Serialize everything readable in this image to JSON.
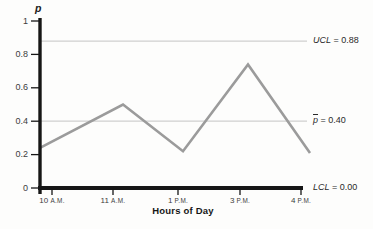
{
  "chart_data": {
    "type": "line",
    "title": "",
    "xlabel": "Hours of Day",
    "ylabel": "p",
    "categories": [
      "10 A.M.",
      "11 A.M.",
      "1 P.M.",
      "3 P.M.",
      "4 P.M."
    ],
    "values": [
      0.24,
      0.5,
      0.22,
      0.74,
      0.21
    ],
    "ylim": [
      0,
      1
    ],
    "y_tick_values": [
      1,
      0.8,
      0.6,
      0.4,
      0.2,
      0
    ],
    "y_tick_labels": [
      "1",
      "0.8",
      "0.6",
      "0.4",
      "0.2",
      "0"
    ],
    "grid": false,
    "legend": "none",
    "reference_lines": [
      {
        "name": "UCL",
        "var": "UCL",
        "value": 0.88,
        "display": "0.88",
        "overline": false,
        "label": "UCL = 0.88"
      },
      {
        "name": "pbar",
        "var": "p",
        "value": 0.4,
        "display": "0.40",
        "overline": true,
        "label": "p̄ = 0.40"
      },
      {
        "name": "LCL",
        "var": "LCL",
        "value": 0.0,
        "display": "0.00",
        "overline": false,
        "label": "LCL = 0.00"
      }
    ],
    "colors": {
      "data_line": "#9b9b9b",
      "reference_line": "#cfcfcf",
      "axis": "#161616",
      "background": "#fdfdfc"
    }
  }
}
